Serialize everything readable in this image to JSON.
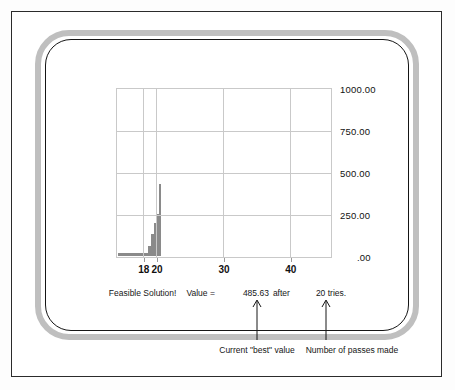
{
  "window": {
    "device_label": "computer-terminal-bezel"
  },
  "status": {
    "message": "Feasible Solution!",
    "value_label": "Value =",
    "value": "485.63",
    "after_word": "after",
    "tries": "20 tries."
  },
  "annotations": [
    {
      "text": "Current \"best\" value",
      "target": "value"
    },
    {
      "text": "Number of passes made",
      "target": "tries"
    }
  ],
  "colors": {
    "bar": "#8a8a8a",
    "grid": "#c9c9c9",
    "bezel": "#bfbfbf",
    "outline": "#151515",
    "text": "#161616"
  },
  "chart_data": {
    "type": "bar",
    "title": "",
    "xlabel": "",
    "ylabel": "",
    "grid": true,
    "legend": false,
    "xlim": [
      14.0,
      46.0
    ],
    "ylim": [
      0,
      1000
    ],
    "ytick_labels": [
      "1000.00",
      "750.00",
      "500.00",
      "250.00",
      ".00"
    ],
    "yticks": [
      1000,
      750,
      500,
      250,
      0
    ],
    "xtick_labels": [
      "18",
      "20",
      "30",
      "40"
    ],
    "xticks": [
      18,
      20,
      30,
      40
    ],
    "bin_edges": [
      14.0,
      18.5,
      19.0,
      19.4,
      19.8,
      20.1,
      20.5
    ],
    "values": [
      18,
      60,
      130,
      195,
      250,
      430
    ],
    "bars": [
      {
        "x0": 14.0,
        "x1": 18.5,
        "value": 18
      },
      {
        "x0": 18.5,
        "x1": 19.0,
        "value": 60
      },
      {
        "x0": 19.0,
        "x1": 19.4,
        "value": 130
      },
      {
        "x0": 19.4,
        "x1": 19.8,
        "value": 195
      },
      {
        "x0": 19.8,
        "x1": 20.1,
        "value": 250
      },
      {
        "x0": 20.1,
        "x1": 20.5,
        "value": 430
      }
    ]
  }
}
